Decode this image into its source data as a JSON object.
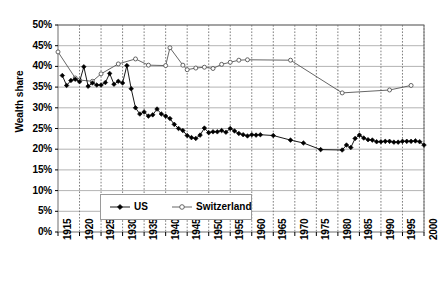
{
  "chart_data": {
    "type": "line",
    "title": "",
    "xlabel": "",
    "ylabel": "Wealth share",
    "xlim": [
      1915,
      2000
    ],
    "ylim": [
      0,
      0.5
    ],
    "grid": true,
    "legend_position": "inside-bottom-center",
    "ytick_labels": [
      "0%",
      "5%",
      "10%",
      "15%",
      "20%",
      "25%",
      "30%",
      "35%",
      "40%",
      "45%",
      "50%"
    ],
    "ytick_values": [
      0,
      5,
      10,
      15,
      20,
      25,
      30,
      35,
      40,
      45,
      50
    ],
    "xtick_labels": [
      "1915",
      "1920",
      "1925",
      "1930",
      "1935",
      "1940",
      "1945",
      "1950",
      "1955",
      "1960",
      "1965",
      "1970",
      "1975",
      "1980",
      "1985",
      "1990",
      "1995",
      "2000"
    ],
    "xtick_values": [
      1915,
      1920,
      1925,
      1930,
      1935,
      1940,
      1945,
      1950,
      1955,
      1960,
      1965,
      1970,
      1975,
      1980,
      1985,
      1990,
      1995,
      2000
    ],
    "series": [
      {
        "name": "US",
        "marker": "filled-diamond",
        "color": "#000000",
        "x": [
          1916,
          1917,
          1918,
          1919,
          1920,
          1921,
          1922,
          1923,
          1924,
          1925,
          1926,
          1927,
          1928,
          1929,
          1930,
          1931,
          1932,
          1933,
          1934,
          1935,
          1936,
          1937,
          1938,
          1939,
          1940,
          1941,
          1942,
          1943,
          1944,
          1945,
          1946,
          1947,
          1948,
          1949,
          1950,
          1951,
          1952,
          1953,
          1954,
          1955,
          1956,
          1957,
          1958,
          1959,
          1960,
          1961,
          1962,
          1965,
          1969,
          1972,
          1976,
          1981,
          1982,
          1983,
          1984,
          1985,
          1986,
          1987,
          1988,
          1989,
          1990,
          1991,
          1992,
          1993,
          1994,
          1995,
          1996,
          1997,
          1998,
          1999,
          2000
        ],
        "y": [
          37.8,
          35.4,
          36.6,
          36.9,
          36.3,
          39.9,
          35.2,
          36.0,
          35.5,
          35.5,
          36.1,
          38.3,
          35.7,
          36.4,
          36.0,
          40.2,
          34.6,
          30.0,
          28.5,
          29.0,
          28.0,
          28.3,
          29.7,
          28.5,
          28.0,
          27.4,
          26.0,
          25.0,
          24.5,
          23.3,
          22.8,
          22.6,
          23.4,
          25.1,
          24.0,
          24.2,
          24.2,
          24.5,
          24.1,
          25.0,
          24.4,
          23.8,
          23.5,
          23.2,
          23.5,
          23.4,
          23.5,
          23.3,
          22.2,
          21.5,
          19.9,
          19.8,
          21.0,
          20.4,
          22.6,
          23.4,
          22.7,
          22.3,
          22.2,
          21.8,
          21.8,
          21.9,
          21.9,
          21.7,
          21.7,
          21.9,
          21.9,
          21.9,
          22.0,
          21.8,
          21.0
        ],
        "units": "percent"
      },
      {
        "name": "Switzerland",
        "marker": "open-circle",
        "color": "#555555",
        "x": [
          1915,
          1919,
          1920,
          1923,
          1925,
          1929,
          1933,
          1936,
          1940,
          1941,
          1944,
          1945,
          1947,
          1949,
          1951,
          1953,
          1955,
          1957,
          1959,
          1969,
          1981,
          1992,
          1997
        ],
        "y": [
          43.5,
          37.2,
          36.7,
          36.4,
          38.2,
          40.6,
          41.8,
          40.3,
          40.2,
          44.5,
          40.3,
          39.2,
          39.6,
          39.8,
          39.5,
          40.5,
          41.0,
          41.5,
          41.6,
          41.5,
          33.6,
          34.3,
          35.4
        ],
        "units": "percent"
      }
    ]
  },
  "legend": {
    "items": [
      {
        "label": "US",
        "marker": "filled-diamond"
      },
      {
        "label": "Switzerland",
        "marker": "open-circle"
      }
    ]
  },
  "axes": {
    "y_title": "Wealth share"
  }
}
